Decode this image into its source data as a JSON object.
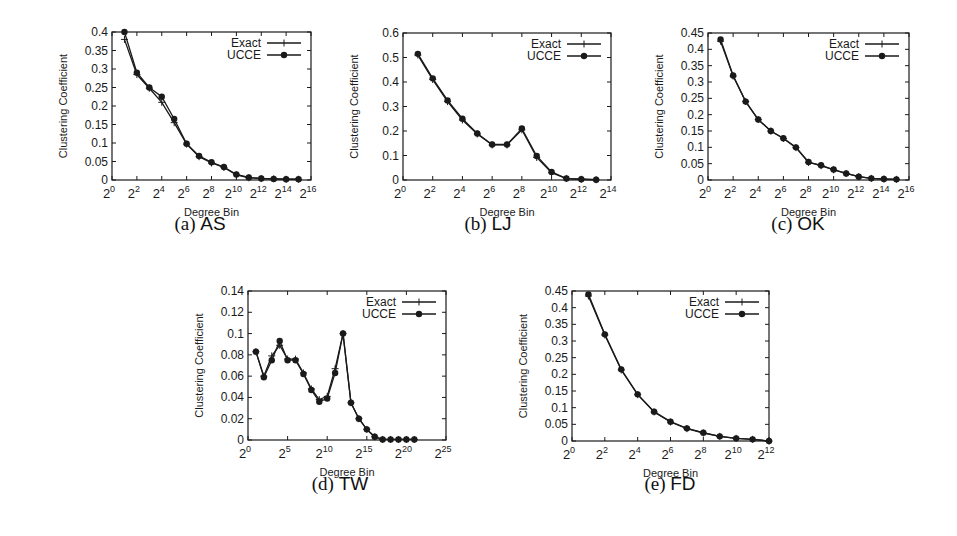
{
  "figure": {
    "panels": [
      {
        "id": "a",
        "caption_label": "(a)",
        "caption_name": "AS"
      },
      {
        "id": "b",
        "caption_label": "(b)",
        "caption_name": "LJ"
      },
      {
        "id": "c",
        "caption_label": "(c)",
        "caption_name": "OK"
      },
      {
        "id": "d",
        "caption_label": "(d)",
        "caption_name": "TW"
      },
      {
        "id": "e",
        "caption_label": "(e)",
        "caption_name": "FD"
      }
    ]
  },
  "chart_data": [
    {
      "id": "a",
      "type": "line",
      "title": "(a) AS",
      "xlabel": "Degree Bin",
      "ylabel": "Clustering Coefficient",
      "x_scale": "log2",
      "xlim_exp": [
        0,
        16
      ],
      "xticks_exp": [
        0,
        2,
        4,
        6,
        8,
        10,
        12,
        14,
        16
      ],
      "ylim": [
        0,
        0.4
      ],
      "yticks": [
        "0",
        "0.05",
        "0.1",
        "0.15",
        "0.2",
        "0.25",
        "0.3",
        "0.35",
        "0.4"
      ],
      "legend": {
        "position": "top-right",
        "entries": [
          "Exact",
          "UCCE"
        ]
      },
      "grid": false,
      "x_exp": [
        1,
        2,
        3,
        4,
        5,
        6,
        7,
        8,
        9,
        10,
        11,
        12,
        13,
        14,
        15
      ],
      "series": [
        {
          "name": "Exact",
          "marker": "plus",
          "values": [
            0.38,
            0.285,
            0.248,
            0.21,
            0.155,
            0.097,
            0.063,
            0.046,
            0.034,
            0.014,
            0.006,
            0.004,
            0.003,
            0.002,
            0.002
          ]
        },
        {
          "name": "UCCE",
          "marker": "circle",
          "values": [
            0.4,
            0.29,
            0.25,
            0.225,
            0.165,
            0.098,
            0.065,
            0.048,
            0.035,
            0.015,
            0.007,
            0.004,
            0.003,
            0.002,
            0.002
          ]
        }
      ]
    },
    {
      "id": "b",
      "type": "line",
      "title": "(b) LJ",
      "xlabel": "Degree Bin",
      "ylabel": "Clustering Coefficient",
      "x_scale": "log2",
      "xlim_exp": [
        0,
        14
      ],
      "xticks_exp": [
        0,
        2,
        4,
        6,
        8,
        10,
        12,
        14
      ],
      "ylim": [
        0,
        0.6
      ],
      "yticks": [
        "0",
        "0.1",
        "0.2",
        "0.3",
        "0.4",
        "0.5",
        "0.6"
      ],
      "legend": {
        "position": "top-right",
        "entries": [
          "Exact",
          "UCCE"
        ]
      },
      "grid": false,
      "x_exp": [
        1,
        2,
        3,
        4,
        5,
        6,
        7,
        8,
        9,
        10,
        11,
        12,
        13
      ],
      "series": [
        {
          "name": "Exact",
          "marker": "plus",
          "values": [
            0.51,
            0.41,
            0.32,
            0.245,
            0.188,
            0.143,
            0.143,
            0.205,
            0.092,
            0.03,
            0.006,
            0.003,
            0.001
          ]
        },
        {
          "name": "UCCE",
          "marker": "circle",
          "values": [
            0.515,
            0.415,
            0.325,
            0.25,
            0.19,
            0.145,
            0.145,
            0.21,
            0.098,
            0.033,
            0.006,
            0.003,
            0.001
          ]
        }
      ]
    },
    {
      "id": "c",
      "type": "line",
      "title": "(c) OK",
      "xlabel": "Degree Bin",
      "ylabel": "Clustering Coefficient",
      "x_scale": "log2",
      "xlim_exp": [
        0,
        16
      ],
      "xticks_exp": [
        0,
        2,
        4,
        6,
        8,
        10,
        12,
        14,
        16
      ],
      "ylim": [
        0,
        0.45
      ],
      "yticks": [
        "0",
        "0.05",
        "0.1",
        "0.15",
        "0.2",
        "0.25",
        "0.3",
        "0.35",
        "0.4",
        "0.45"
      ],
      "legend": {
        "position": "top-right",
        "entries": [
          "Exact",
          "UCCE"
        ]
      },
      "grid": false,
      "x_exp": [
        1,
        2,
        3,
        4,
        5,
        6,
        7,
        8,
        9,
        10,
        11,
        12,
        13,
        14,
        15
      ],
      "series": [
        {
          "name": "Exact",
          "marker": "plus",
          "values": [
            0.425,
            0.318,
            0.24,
            0.185,
            0.15,
            0.127,
            0.099,
            0.054,
            0.044,
            0.031,
            0.02,
            0.01,
            0.005,
            0.003,
            0.002
          ]
        },
        {
          "name": "UCCE",
          "marker": "circle",
          "values": [
            0.43,
            0.32,
            0.24,
            0.185,
            0.15,
            0.128,
            0.1,
            0.055,
            0.045,
            0.032,
            0.02,
            0.01,
            0.005,
            0.003,
            0.002
          ]
        }
      ]
    },
    {
      "id": "d",
      "type": "line",
      "title": "(d) TW",
      "xlabel": "Degree Bin",
      "ylabel": "Clustering Coefficient",
      "x_scale": "log2",
      "xlim_exp": [
        0,
        25
      ],
      "xticks_exp": [
        0,
        5,
        10,
        15,
        20,
        25
      ],
      "ylim": [
        0,
        0.14
      ],
      "yticks": [
        "0",
        "0.02",
        "0.04",
        "0.06",
        "0.08",
        "0.1",
        "0.12",
        "0.14"
      ],
      "legend": {
        "position": "top-right",
        "entries": [
          "Exact",
          "UCCE"
        ]
      },
      "grid": false,
      "x_exp": [
        1,
        2,
        3,
        4,
        5,
        6,
        7,
        8,
        9,
        10,
        11,
        12,
        13,
        14,
        15,
        16,
        17,
        18,
        19,
        20,
        21
      ],
      "series": [
        {
          "name": "Exact",
          "marker": "plus",
          "values": [
            0.083,
            0.06,
            0.079,
            0.089,
            0.076,
            0.076,
            0.063,
            0.048,
            0.038,
            0.041,
            0.067,
            0.1,
            0.035,
            0.02,
            0.01,
            0.003,
            0.0005,
            0.0005,
            0.0005,
            0.0005,
            0.0005
          ]
        },
        {
          "name": "UCCE",
          "marker": "circle",
          "values": [
            0.083,
            0.059,
            0.075,
            0.093,
            0.075,
            0.075,
            0.062,
            0.047,
            0.036,
            0.039,
            0.063,
            0.1,
            0.035,
            0.02,
            0.01,
            0.003,
            0.0005,
            0.0005,
            0.0005,
            0.0005,
            0.0005
          ]
        }
      ]
    },
    {
      "id": "e",
      "type": "line",
      "title": "(e) FD",
      "xlabel": "Degree Bin",
      "ylabel": "Clustering Coefficient",
      "x_scale": "log2",
      "xlim_exp": [
        0,
        12
      ],
      "xticks_exp": [
        0,
        2,
        4,
        6,
        8,
        10,
        12
      ],
      "ylim": [
        0,
        0.45
      ],
      "yticks": [
        "0",
        "0.05",
        "0.1",
        "0.15",
        "0.2",
        "0.25",
        "0.3",
        "0.35",
        "0.4",
        "0.45"
      ],
      "legend": {
        "position": "top-right",
        "entries": [
          "Exact",
          "UCCE"
        ]
      },
      "grid": false,
      "x_exp": [
        1,
        2,
        3,
        4,
        5,
        6,
        7,
        8,
        9,
        10,
        11,
        12
      ],
      "series": [
        {
          "name": "Exact",
          "marker": "plus",
          "values": [
            0.435,
            0.318,
            0.213,
            0.139,
            0.087,
            0.057,
            0.037,
            0.024,
            0.014,
            0.008,
            0.005,
            0.0
          ]
        },
        {
          "name": "UCCE",
          "marker": "circle",
          "values": [
            0.44,
            0.32,
            0.215,
            0.14,
            0.088,
            0.058,
            0.038,
            0.025,
            0.014,
            0.008,
            0.005,
            0.0
          ]
        }
      ]
    }
  ]
}
